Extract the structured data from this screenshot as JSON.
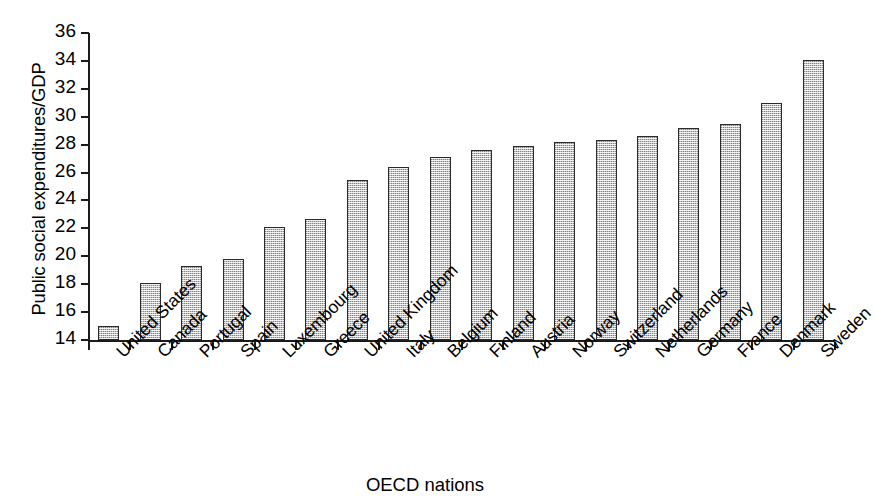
{
  "chart_data": {
    "type": "bar",
    "title": "",
    "xlabel": "OECD nations",
    "ylabel": "Public social expenditures/GDP",
    "ylim": [
      14,
      36
    ],
    "ytick_step": 2,
    "yticks": [
      36,
      34,
      32,
      30,
      28,
      26,
      24,
      22,
      20,
      18,
      16,
      14
    ],
    "grid": false,
    "legend": "none",
    "bar_fill_color": "#c4c4c4",
    "bar_border_color": "#2b2b2b",
    "categories": [
      "United States",
      "Canada",
      "Portugal",
      "Spain",
      "Luxembourg",
      "Greece",
      "United Kingdom",
      "Italy",
      "Belgium",
      "Finland",
      "Austria",
      "Norway",
      "Switzerland",
      "Netherlands",
      "Germany",
      "France",
      "Denmark",
      "Sweden"
    ],
    "values": [
      15.0,
      18.1,
      19.3,
      19.8,
      22.1,
      22.7,
      25.5,
      26.4,
      27.1,
      27.6,
      27.9,
      28.2,
      28.3,
      28.6,
      29.2,
      29.5,
      31.0,
      34.1
    ]
  },
  "artifact": {
    "top_cropped_text": ",        ,"
  }
}
